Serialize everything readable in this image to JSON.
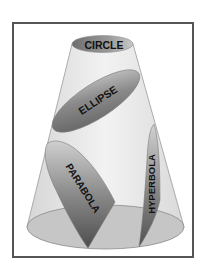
{
  "diagram": {
    "sections": [
      {
        "id": "circle",
        "label": "CIRCLE"
      },
      {
        "id": "ellipse",
        "label": "ELLIPSE"
      },
      {
        "id": "parabola",
        "label": "PARABOLA"
      },
      {
        "id": "hyperbola",
        "label": "HYPERBOLA"
      }
    ],
    "colors": {
      "frame": "#555555",
      "cone_fill": "#ececec",
      "cone_outline": "#9a9a9a",
      "section_dark": "#6a6a6a",
      "section_light": "#c8c8c8",
      "base_fill": "#c4c4c4"
    }
  }
}
